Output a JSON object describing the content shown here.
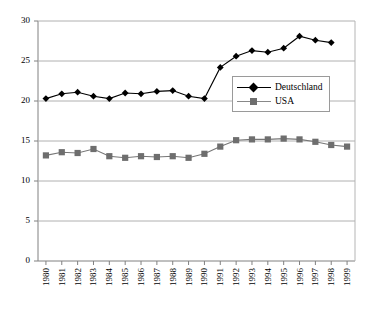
{
  "chart_data": {
    "type": "line",
    "title": "",
    "xlabel": "",
    "ylabel": "",
    "x": [
      1980,
      1981,
      1982,
      1983,
      1984,
      1985,
      1986,
      1987,
      1988,
      1989,
      1990,
      1991,
      1992,
      1993,
      1994,
      1995,
      1996,
      1997,
      1998,
      1999
    ],
    "categories": [
      "1980",
      "1981",
      "1982",
      "1983",
      "1984",
      "1985",
      "1986",
      "1987",
      "1988",
      "1989",
      "1990",
      "1991",
      "1992",
      "1993",
      "1994",
      "1995",
      "1996",
      "1997",
      "1998",
      "1999"
    ],
    "series": [
      {
        "name": "Deutschland",
        "marker": "diamond",
        "color": "#000000",
        "values": [
          20.3,
          20.9,
          21.1,
          20.6,
          20.3,
          21.0,
          20.9,
          21.2,
          21.3,
          20.6,
          20.3,
          24.2,
          25.6,
          26.3,
          26.1,
          26.6,
          28.1,
          27.6,
          27.3,
          null
        ]
      },
      {
        "name": "USA",
        "marker": "square",
        "color": "#666666",
        "values": [
          13.2,
          13.6,
          13.5,
          14.0,
          13.1,
          12.9,
          13.1,
          13.0,
          13.1,
          12.9,
          13.4,
          14.3,
          15.1,
          15.2,
          15.2,
          15.3,
          15.2,
          14.9,
          14.5,
          14.3
        ]
      }
    ],
    "ylim": [
      0,
      30
    ],
    "yticks": [
      0,
      5,
      10,
      15,
      20,
      25,
      30
    ],
    "ytick_labels": [
      "0",
      "5",
      "10",
      "15",
      "20",
      "25",
      "30"
    ],
    "grid": "horizontal",
    "legend_position": "center-right",
    "legend_entries": [
      "Deutschland",
      "USA"
    ]
  },
  "axis": {
    "y_tick_labels": [
      "30",
      "25",
      "20",
      "15",
      "10",
      "5",
      "0"
    ]
  },
  "legend": {
    "items": [
      {
        "label": "Deutschland"
      },
      {
        "label": "USA"
      }
    ]
  }
}
